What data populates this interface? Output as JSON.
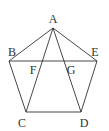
{
  "figure": {
    "type": "geometry",
    "points": {
      "A": {
        "label": "A",
        "x": 53,
        "y": 28,
        "lx": 53,
        "ly": 23
      },
      "B": {
        "label": "B",
        "x": 9,
        "y": 61,
        "lx": 12,
        "ly": 56
      },
      "C": {
        "label": "C",
        "x": 26,
        "y": 112,
        "lx": 22,
        "ly": 127
      },
      "D": {
        "label": "D",
        "x": 81,
        "y": 112,
        "lx": 84,
        "ly": 127
      },
      "E": {
        "label": "E",
        "x": 97,
        "y": 61,
        "lx": 95,
        "ly": 56
      },
      "F": {
        "label": "F",
        "x": 37,
        "y": 61,
        "lx": 33,
        "ly": 74
      },
      "G": {
        "label": "G",
        "x": 66,
        "y": 61,
        "lx": 71,
        "ly": 74
      }
    },
    "segments": [
      [
        "A",
        "B"
      ],
      [
        "B",
        "C"
      ],
      [
        "C",
        "D"
      ],
      [
        "D",
        "E"
      ],
      [
        "E",
        "A"
      ],
      [
        "B",
        "E"
      ],
      [
        "A",
        "C"
      ],
      [
        "A",
        "D"
      ]
    ],
    "stroke_color": "#333333"
  }
}
